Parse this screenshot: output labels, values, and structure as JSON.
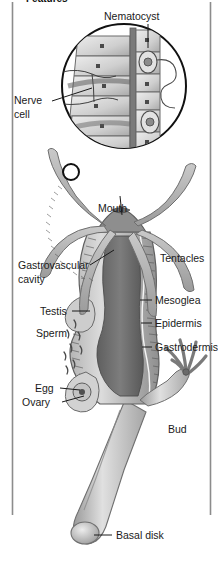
{
  "figure": {
    "title_partial": "Features",
    "background_color": "#ffffff",
    "rule_color": "#8c8c8c",
    "label_color": "#1a1a1a",
    "leader_color": "#1a1a1a"
  },
  "labels": {
    "nematocyst": "Nematocyst",
    "nerve_line1": "Nerve",
    "nerve_line2": "cell",
    "mouth": "Mouth",
    "tentacles": "Tentacles",
    "gastrovascular_line1": "Gastrovascular",
    "gastrovascular_line2": "cavity",
    "mesoglea": "Mesoglea",
    "epidermis": "Epidermis",
    "gastrodermis": "Gastrodermis",
    "testis": "Testis",
    "sperm": "Sperm",
    "egg": "Egg",
    "ovary": "Ovary",
    "bud": "Bud",
    "basal_disk": "Basal disk"
  },
  "anatomy": {
    "inset": {
      "name": "magnified-body-wall",
      "shape": "circle",
      "center_x": 124,
      "center_y": 86,
      "radius": 63,
      "contents": [
        "epitheliomuscular-cells",
        "nerve-cell-network",
        "nematocyst-capsules",
        "mesoglea-band"
      ]
    },
    "magnifier_marker": {
      "name": "tentacle-magnify-marker",
      "center_x": 71,
      "center_y": 172,
      "radius": 8
    },
    "tentacle_count": 6,
    "bud": {
      "tentacle_count": 5
    }
  },
  "palette": {
    "tissue_light": "#cfcfcf",
    "tissue_mid": "#a8a8a8",
    "tissue_dark": "#6e6e6e",
    "cavity_dark": "#5a5a5a",
    "outline": "#4a4a4a",
    "cell_fill": "#d8d8d8"
  }
}
